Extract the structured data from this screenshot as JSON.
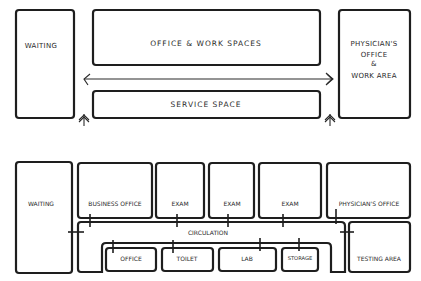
{
  "diagrams": {
    "top": {
      "waiting": "WAITING",
      "office_work": "OFFICE & WORK SPACES",
      "service": "SERVICE SPACE",
      "physician_line1": "PHYSICIAN'S",
      "physician_line2": "OFFICE",
      "physician_line3": "&",
      "physician_line4": "WORK AREA"
    },
    "bottom": {
      "waiting": "WAITING",
      "business_office": "BUSINESS OFFICE",
      "exam_1": "EXAM",
      "exam_2": "EXAM",
      "exam_3": "EXAM",
      "physicians_office": "PHYSICIAN'S OFFICE",
      "circulation": "CIRCULATION",
      "office": "OFFICE",
      "toilet": "TOILET",
      "lab": "LAB",
      "storage": "STORAGE",
      "testing_area": "TESTING AREA"
    }
  },
  "colors": {
    "ink": "#1e1e1e",
    "paper": "#ffffff"
  }
}
